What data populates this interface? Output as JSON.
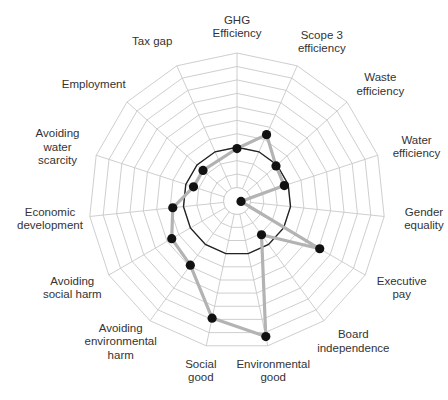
{
  "chart_data": {
    "type": "radar",
    "title": "",
    "axes": [
      {
        "label": [
          "GHG",
          "Efficiency"
        ]
      },
      {
        "label": [
          "Scope 3",
          "efficiency"
        ]
      },
      {
        "label": [
          "Waste",
          "efficiency"
        ]
      },
      {
        "label": [
          "Water",
          "efficiency"
        ]
      },
      {
        "label": [
          "Gender",
          "equality"
        ]
      },
      {
        "label": [
          "Executive",
          "pay"
        ]
      },
      {
        "label": [
          "Board",
          "independence"
        ]
      },
      {
        "label": [
          "Environmental",
          "good"
        ]
      },
      {
        "label": [
          "Social",
          "good"
        ]
      },
      {
        "label": [
          "Avoiding",
          "environmental",
          "harm"
        ]
      },
      {
        "label": [
          "Avoiding",
          "social harm"
        ]
      },
      {
        "label": [
          "Economic",
          "development"
        ]
      },
      {
        "label": [
          "Avoiding",
          "water",
          "scarcity"
        ]
      },
      {
        "label": [
          "Employment"
        ]
      },
      {
        "label": [
          "Tax gap"
        ]
      }
    ],
    "categories": [
      "GHG Efficiency",
      "Scope 3 efficiency",
      "Waste efficiency",
      "Water efficiency",
      "Gender equality",
      "Executive pay",
      "Board independence",
      "Environmental good",
      "Social good",
      "Avoiding environmental harm",
      "Avoiding social harm",
      "Economic development",
      "Avoiding water scarcity",
      "Employment",
      "Tax gap"
    ],
    "series": [
      {
        "name": "Company score",
        "color": "#b3b3b3",
        "marker_color": "#111111",
        "values": [
          3.9,
          5.4,
          3.9,
          3.7,
          0.3,
          7.1,
          3.1,
          10.3,
          8.9,
          5.9,
          5.6,
          4.8,
          3.4,
          3.4,
          null
        ]
      },
      {
        "name": "Benchmark",
        "color": "#222222",
        "values": [
          4,
          4,
          4,
          4,
          4,
          4,
          4,
          4,
          4,
          4,
          4,
          4,
          4,
          4,
          4
        ]
      }
    ],
    "rings": 11,
    "range": [
      0,
      11
    ],
    "grid": true,
    "legend": "none"
  },
  "layout": {
    "center": [
      237,
      201
    ],
    "radius": 148,
    "grid_color": "#c8c8c8",
    "benchmark_color": "#222222",
    "series_color": "#b3b3b3",
    "marker_color": "#111111"
  }
}
